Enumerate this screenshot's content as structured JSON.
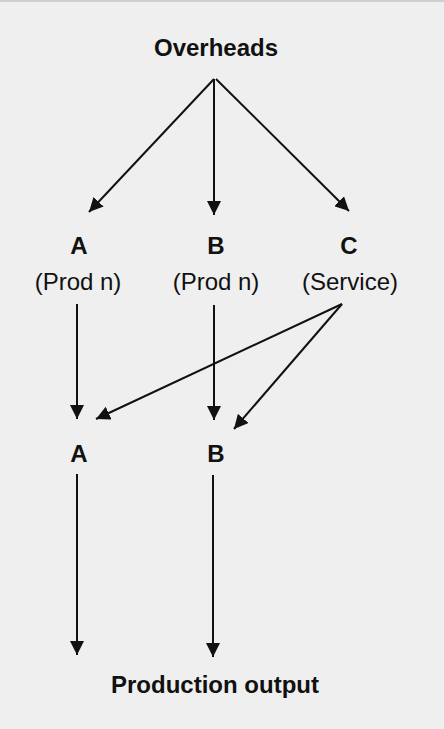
{
  "diagram": {
    "top": {
      "label": "Overheads"
    },
    "departments": [
      {
        "letter": "A",
        "type": "(Prod n)"
      },
      {
        "letter": "B",
        "type": "(Prod n)"
      },
      {
        "letter": "C",
        "type": "(Service)"
      }
    ],
    "reapportioned": [
      {
        "letter": "A"
      },
      {
        "letter": "B"
      }
    ],
    "bottom": {
      "label": "Production output"
    },
    "edges": [
      {
        "from": "Overheads",
        "to": "A (Prod n)"
      },
      {
        "from": "Overheads",
        "to": "B (Prod n)"
      },
      {
        "from": "Overheads",
        "to": "C (Service)"
      },
      {
        "from": "A (Prod n)",
        "to": "A"
      },
      {
        "from": "B (Prod n)",
        "to": "B"
      },
      {
        "from": "C (Service)",
        "to": "A"
      },
      {
        "from": "C (Service)",
        "to": "B"
      },
      {
        "from": "A",
        "to": "Production output"
      },
      {
        "from": "B",
        "to": "Production output"
      }
    ],
    "colors": {
      "background": "#efefef",
      "ink": "#111111"
    }
  }
}
